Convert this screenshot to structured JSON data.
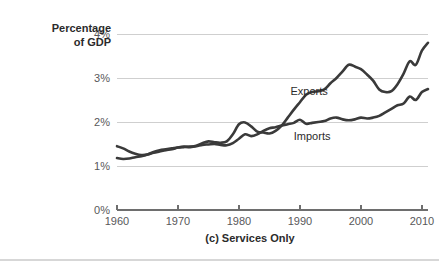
{
  "chart_data": {
    "type": "line",
    "title": "",
    "caption": "(c) Services Only",
    "ylabel_line1": "Percentage",
    "ylabel_line2": "of GDP",
    "xlabel": "",
    "xlim": [
      1960,
      2011
    ],
    "ylim": [
      0,
      4
    ],
    "grid": true,
    "gridlines_y": [
      1,
      2,
      3,
      4
    ],
    "yticks": [
      0,
      1,
      2,
      3,
      4
    ],
    "ytick_labels": [
      "0%",
      "1%",
      "2%",
      "3%",
      "4%"
    ],
    "xticks": [
      1960,
      1970,
      1980,
      1990,
      2000,
      2010
    ],
    "xtick_labels": [
      "1960",
      "1970",
      "1980",
      "1990",
      "2000",
      "2010"
    ],
    "legend_position": "inline-annotation",
    "colors": {
      "exports_line": "#3a3a3a",
      "imports_line": "#3a3a3a",
      "gridline": "#cfcfcf",
      "axis": "#6e6e6e",
      "text": "#2b2b2b",
      "tick_text": "#58585a"
    },
    "annotations": [
      {
        "label": "Exports",
        "x": 1991.5,
        "y": 2.62
      },
      {
        "label": "Imports",
        "x": 1992.0,
        "y": 1.58
      }
    ],
    "x": [
      1960,
      1961,
      1962,
      1963,
      1964,
      1965,
      1966,
      1967,
      1968,
      1969,
      1970,
      1971,
      1972,
      1973,
      1974,
      1975,
      1976,
      1977,
      1978,
      1979,
      1980,
      1981,
      1982,
      1983,
      1984,
      1985,
      1986,
      1987,
      1988,
      1989,
      1990,
      1991,
      1992,
      1993,
      1994,
      1995,
      1996,
      1997,
      1998,
      1999,
      2000,
      2001,
      2002,
      2003,
      2004,
      2005,
      2006,
      2007,
      2008,
      2009,
      2010,
      2011
    ],
    "series": [
      {
        "name": "Exports",
        "values": [
          1.45,
          1.4,
          1.33,
          1.28,
          1.25,
          1.26,
          1.3,
          1.33,
          1.36,
          1.38,
          1.42,
          1.44,
          1.43,
          1.46,
          1.52,
          1.56,
          1.54,
          1.53,
          1.56,
          1.72,
          1.95,
          1.99,
          1.9,
          1.78,
          1.76,
          1.74,
          1.8,
          1.92,
          2.1,
          2.28,
          2.45,
          2.62,
          2.68,
          2.7,
          2.74,
          2.88,
          3.0,
          3.15,
          3.3,
          3.26,
          3.2,
          3.08,
          2.94,
          2.74,
          2.68,
          2.7,
          2.86,
          3.1,
          3.38,
          3.3,
          3.62,
          3.8
        ]
      },
      {
        "name": "Imports",
        "values": [
          1.18,
          1.16,
          1.17,
          1.2,
          1.22,
          1.26,
          1.32,
          1.36,
          1.38,
          1.4,
          1.42,
          1.43,
          1.44,
          1.45,
          1.48,
          1.49,
          1.5,
          1.48,
          1.47,
          1.52,
          1.62,
          1.72,
          1.68,
          1.72,
          1.8,
          1.86,
          1.88,
          1.92,
          1.95,
          1.98,
          2.05,
          1.96,
          1.98,
          2.0,
          2.02,
          2.08,
          2.1,
          2.06,
          2.04,
          2.06,
          2.1,
          2.08,
          2.1,
          2.14,
          2.22,
          2.3,
          2.38,
          2.42,
          2.58,
          2.5,
          2.68,
          2.75
        ]
      }
    ]
  }
}
